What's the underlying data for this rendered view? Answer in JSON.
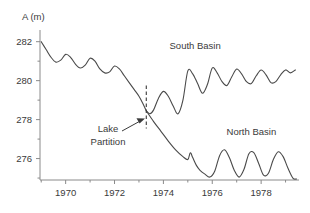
{
  "chart_data": {
    "type": "line",
    "title": "",
    "xlabel": "",
    "ylabel": "A (m)",
    "ylim": [
      274.9,
      282.6
    ],
    "xlim": [
      1968.95,
      1979.55
    ],
    "grid": false,
    "legend": "none",
    "y_ticks": [
      276,
      278,
      280,
      282
    ],
    "y_tick_labels": [
      "276",
      "278",
      "280",
      "282"
    ],
    "y_minor_ticks": [
      275,
      277,
      279,
      281
    ],
    "x_ticks": [
      1970,
      1972,
      1974,
      1976,
      1978
    ],
    "x_tick_labels": [
      "1970",
      "1972",
      "1974",
      "1976",
      "1978"
    ],
    "x_minor_ticks": [
      1969,
      1971,
      1973,
      1975,
      1977,
      1979
    ],
    "annotations": [
      {
        "name": "lake-partition",
        "text_line1": "Lake",
        "text_line2": "Partition",
        "x": 1973.3,
        "marker": "dashed-vertical-line"
      },
      {
        "name": "south-basin-label",
        "text": "South Basin",
        "x": 1975.3,
        "y": 281.6
      },
      {
        "name": "north-basin-label",
        "text": "North Basin",
        "x": 1977.6,
        "y": 277.2
      }
    ],
    "series": [
      {
        "name": "Whole Lake",
        "label": "",
        "x": [
          1969.0,
          1969.2,
          1969.4,
          1969.6,
          1969.8,
          1970.0,
          1970.2,
          1970.4,
          1970.6,
          1970.8,
          1971.0,
          1971.2,
          1971.4,
          1971.6,
          1971.8,
          1972.0,
          1972.2,
          1972.4,
          1972.6,
          1972.8,
          1973.0,
          1973.15,
          1973.3
        ],
        "values": [
          282.0,
          281.6,
          281.2,
          280.95,
          281.05,
          281.35,
          281.2,
          280.85,
          280.65,
          280.8,
          281.15,
          281.0,
          280.6,
          280.4,
          280.45,
          280.75,
          280.6,
          280.25,
          279.9,
          279.55,
          279.2,
          278.85,
          278.45
        ]
      },
      {
        "name": "South Basin",
        "label": "South Basin",
        "x": [
          1973.3,
          1973.45,
          1973.6,
          1973.8,
          1974.0,
          1974.2,
          1974.4,
          1974.6,
          1974.8,
          1975.0,
          1975.2,
          1975.4,
          1975.6,
          1975.8,
          1976.0,
          1976.2,
          1976.4,
          1976.6,
          1976.8,
          1977.0,
          1977.2,
          1977.4,
          1977.6,
          1977.8,
          1978.0,
          1978.2,
          1978.4,
          1978.6,
          1978.8,
          1979.0,
          1979.2,
          1979.4
        ],
        "values": [
          278.45,
          278.3,
          278.5,
          279.1,
          279.45,
          279.2,
          278.7,
          278.3,
          279.0,
          280.5,
          280.35,
          279.85,
          279.35,
          279.8,
          280.65,
          280.4,
          279.95,
          279.75,
          280.2,
          280.6,
          280.35,
          279.95,
          279.85,
          280.25,
          280.55,
          280.3,
          279.9,
          279.95,
          280.3,
          280.55,
          280.4,
          280.55
        ]
      },
      {
        "name": "North Basin",
        "label": "North Basin",
        "x": [
          1973.3,
          1973.6,
          1973.9,
          1974.2,
          1974.5,
          1974.8,
          1975.0,
          1975.1,
          1975.2,
          1975.35,
          1975.5,
          1975.7,
          1975.9,
          1976.1,
          1976.3,
          1976.5,
          1976.7,
          1976.9,
          1977.1,
          1977.3,
          1977.5,
          1977.7,
          1977.9,
          1978.1,
          1978.3,
          1978.5,
          1978.7,
          1978.9,
          1979.1,
          1979.3,
          1979.45
        ],
        "values": [
          278.45,
          277.9,
          277.4,
          276.9,
          276.45,
          276.1,
          275.95,
          276.3,
          276.05,
          275.65,
          275.4,
          275.2,
          275.05,
          275.35,
          276.15,
          276.45,
          276.05,
          275.4,
          275.05,
          275.45,
          276.25,
          276.3,
          275.75,
          275.15,
          275.25,
          275.95,
          276.35,
          276.1,
          275.5,
          275.0,
          274.95
        ]
      }
    ]
  }
}
